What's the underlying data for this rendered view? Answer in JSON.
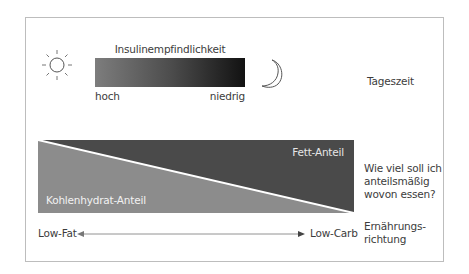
{
  "diagram": {
    "top_row": {
      "left_icon": "sun-icon",
      "right_icon": "moon-icon",
      "bar_title": "Insulinempfindlichkeit",
      "bar_left_label": "hoch",
      "bar_right_label": "niedrig",
      "bar_gradient": {
        "from": "#7d7d7d",
        "to": "#121212"
      },
      "row_label": "Tageszeit"
    },
    "middle_row": {
      "upper_region_label": "Fett-Anteil",
      "lower_region_label": "Kohlenhydrat-Anteil",
      "upper_color": "#4a4a4a",
      "lower_color": "#8c8c8c",
      "divider_color": "#ffffff",
      "question_line1": "Wie viel soll ich",
      "question_line2": "anteilsmäßig",
      "question_line3": "wovon essen?"
    },
    "bottom_row": {
      "left_label": "Low-Fat",
      "right_label": "Low-Carb",
      "arrow_icon": "double-arrow-icon",
      "row_label_line1": "Ernährungs-",
      "row_label_line2": "richtung"
    }
  }
}
